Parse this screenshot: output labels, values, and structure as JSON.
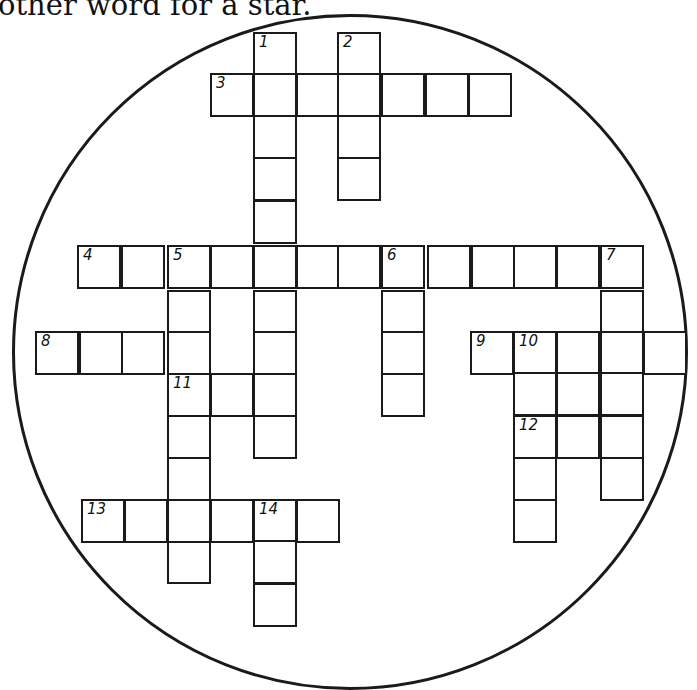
{
  "puzzle": {
    "clue_fragment": "other word for a star.",
    "circle": {
      "cx": 350,
      "cy": 352,
      "r": 338,
      "color": "#1a1a1a"
    },
    "cell_size": 43,
    "cells": [
      {
        "x": 253,
        "y": 32,
        "n": "1"
      },
      {
        "x": 253,
        "y": 73
      },
      {
        "x": 253,
        "y": 115
      },
      {
        "x": 253,
        "y": 157
      },
      {
        "x": 253,
        "y": 200
      },
      {
        "x": 253,
        "y": 290
      },
      {
        "x": 253,
        "y": 331
      },
      {
        "x": 253,
        "y": 415
      },
      {
        "x": 337,
        "y": 32,
        "n": "2"
      },
      {
        "x": 337,
        "y": 115
      },
      {
        "x": 337,
        "y": 157
      },
      {
        "x": 210,
        "y": 73,
        "n": "3"
      },
      {
        "x": 296,
        "y": 73
      },
      {
        "x": 337,
        "y": 73
      },
      {
        "x": 381,
        "y": 73
      },
      {
        "x": 425,
        "y": 73
      },
      {
        "x": 468,
        "y": 73
      },
      {
        "x": 77,
        "y": 245,
        "n": "4"
      },
      {
        "x": 121,
        "y": 245
      },
      {
        "x": 167,
        "y": 245,
        "n": "5"
      },
      {
        "x": 210,
        "y": 245
      },
      {
        "x": 253,
        "y": 245
      },
      {
        "x": 296,
        "y": 245
      },
      {
        "x": 337,
        "y": 245
      },
      {
        "x": 381,
        "y": 245,
        "n": "6"
      },
      {
        "x": 427,
        "y": 245
      },
      {
        "x": 471,
        "y": 245
      },
      {
        "x": 513,
        "y": 245
      },
      {
        "x": 556,
        "y": 245
      },
      {
        "x": 600,
        "y": 245,
        "n": "7"
      },
      {
        "x": 167,
        "y": 290
      },
      {
        "x": 167,
        "y": 331
      },
      {
        "x": 167,
        "y": 415
      },
      {
        "x": 167,
        "y": 457
      },
      {
        "x": 167,
        "y": 540
      },
      {
        "x": 381,
        "y": 290
      },
      {
        "x": 381,
        "y": 331
      },
      {
        "x": 381,
        "y": 373
      },
      {
        "x": 600,
        "y": 290
      },
      {
        "x": 600,
        "y": 331
      },
      {
        "x": 600,
        "y": 372
      },
      {
        "x": 600,
        "y": 415
      },
      {
        "x": 600,
        "y": 457
      },
      {
        "x": 35,
        "y": 331,
        "n": "8"
      },
      {
        "x": 79,
        "y": 331
      },
      {
        "x": 121,
        "y": 331
      },
      {
        "x": 470,
        "y": 331,
        "n": "9"
      },
      {
        "x": 513,
        "y": 331,
        "n": "10"
      },
      {
        "x": 556,
        "y": 331
      },
      {
        "x": 643,
        "y": 331
      },
      {
        "x": 513,
        "y": 372
      },
      {
        "x": 556,
        "y": 372
      },
      {
        "x": 513,
        "y": 457
      },
      {
        "x": 513,
        "y": 499
      },
      {
        "x": 167,
        "y": 373,
        "n": "11"
      },
      {
        "x": 210,
        "y": 373
      },
      {
        "x": 253,
        "y": 373
      },
      {
        "x": 513,
        "y": 415,
        "n": "12"
      },
      {
        "x": 556,
        "y": 415
      },
      {
        "x": 81,
        "y": 499,
        "n": "13"
      },
      {
        "x": 124,
        "y": 499
      },
      {
        "x": 167,
        "y": 499
      },
      {
        "x": 210,
        "y": 499
      },
      {
        "x": 253,
        "y": 499,
        "n": "14"
      },
      {
        "x": 296,
        "y": 499
      },
      {
        "x": 253,
        "y": 540
      },
      {
        "x": 253,
        "y": 583
      }
    ]
  }
}
